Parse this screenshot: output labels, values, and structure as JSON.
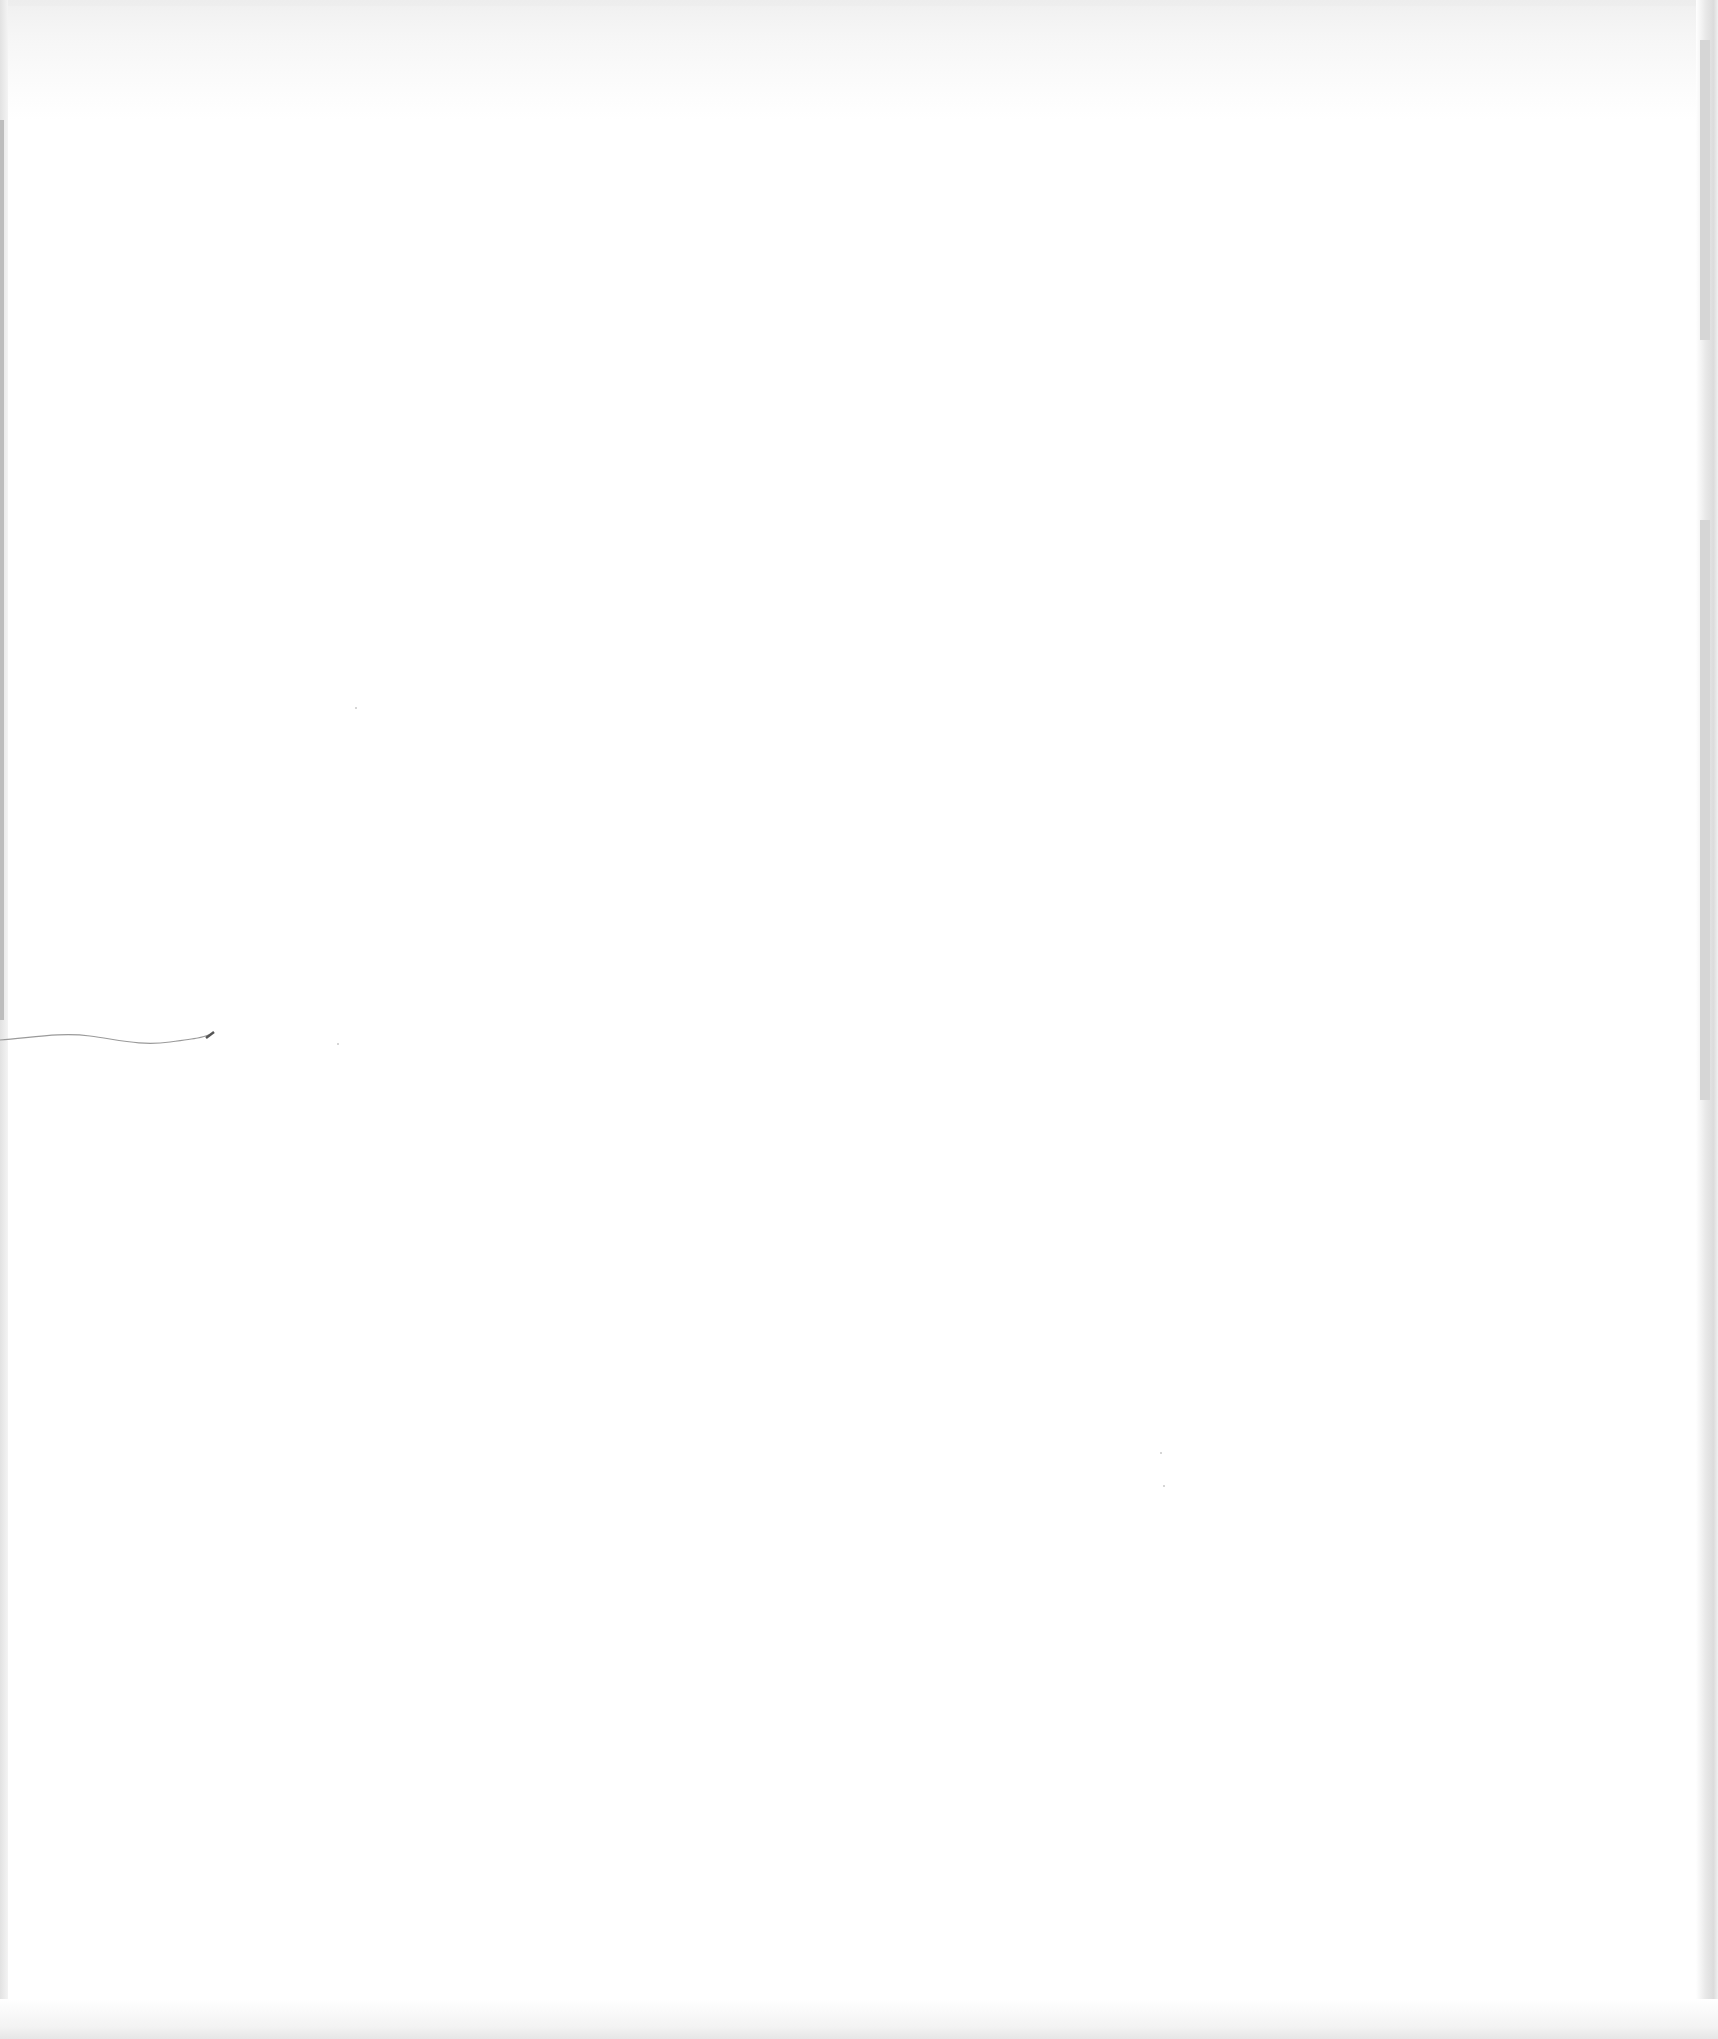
{
  "page": {
    "type": "scanned-blank-page",
    "background_color": "#ffffff",
    "edge_shadow_color": "#dcdcdc",
    "bleed_through_color": "#eeeeee",
    "text_content": ""
  },
  "marks": [
    {
      "kind": "pen-squiggle",
      "color": "#9a9a9a",
      "position": "left-middle"
    }
  ]
}
